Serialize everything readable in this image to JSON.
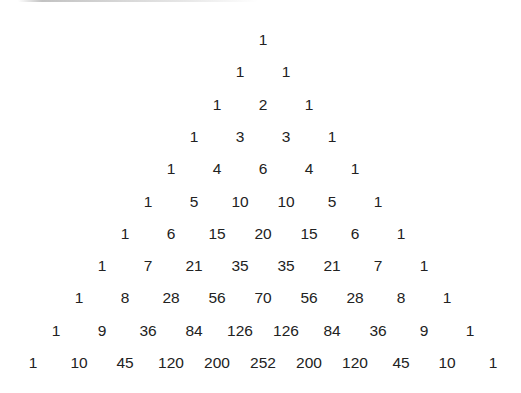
{
  "layout": {
    "center_x": 263,
    "top_y": 40,
    "row_spacing": 32.3,
    "col_spacing": 46
  },
  "colors": {
    "text": "#222222",
    "background": "#ffffff"
  },
  "rows": [
    [
      1
    ],
    [
      1,
      1
    ],
    [
      1,
      2,
      1
    ],
    [
      1,
      3,
      3,
      1
    ],
    [
      1,
      4,
      6,
      4,
      1
    ],
    [
      1,
      5,
      10,
      10,
      5,
      1
    ],
    [
      1,
      6,
      15,
      20,
      15,
      6,
      1
    ],
    [
      1,
      7,
      21,
      35,
      35,
      21,
      7,
      1
    ],
    [
      1,
      8,
      28,
      56,
      70,
      56,
      28,
      8,
      1
    ],
    [
      1,
      9,
      36,
      84,
      126,
      126,
      84,
      36,
      9,
      1
    ],
    [
      1,
      10,
      45,
      120,
      200,
      252,
      200,
      120,
      45,
      10,
      1
    ]
  ]
}
